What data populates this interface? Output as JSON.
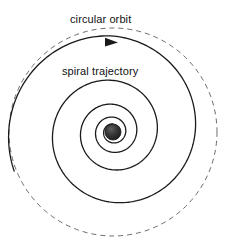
{
  "figure": {
    "type": "diagram",
    "background_color": "#ffffff",
    "width": 226,
    "height": 245
  },
  "labels": {
    "circular_orbit": "circular orbit",
    "spiral_trajectory": "spiral trajectory"
  },
  "chart_data": {
    "type": "line",
    "title": "",
    "xlabel": "",
    "ylabel": "",
    "center": {
      "x": 113,
      "y": 132
    },
    "elements": [
      {
        "name": "circular-orbit",
        "shape": "circle",
        "style": "dashed",
        "color": "#6b6b6b",
        "radius": 104,
        "label": "circular orbit"
      },
      {
        "name": "spiral-trajectory",
        "shape": "spiral",
        "style": "solid",
        "color": "#1a1a1a",
        "direction": "inward",
        "turns": 4,
        "r_start": 96,
        "r_end": 8,
        "label": "spiral trajectory"
      },
      {
        "name": "central-body",
        "shape": "filled-circle",
        "color": "#2b2b2b",
        "radius": 8
      },
      {
        "name": "direction-arrow",
        "shape": "arrowhead",
        "color": "#1a1a1a",
        "x": 113,
        "y": 42,
        "direction": "clockwise"
      }
    ],
    "radial_crossings_right": [
      123,
      138,
      160,
      188,
      216
    ],
    "radial_crossings_left": [
      8,
      17,
      55,
      85,
      100
    ],
    "grid": false,
    "legend": "none"
  },
  "colors": {
    "stroke_solid": "#1a1a1a",
    "stroke_dashed": "#6b6b6b",
    "body_fill": "#2b2b2b",
    "body_highlight": "#6a6a6a",
    "text": "#111111",
    "background": "#ffffff"
  }
}
